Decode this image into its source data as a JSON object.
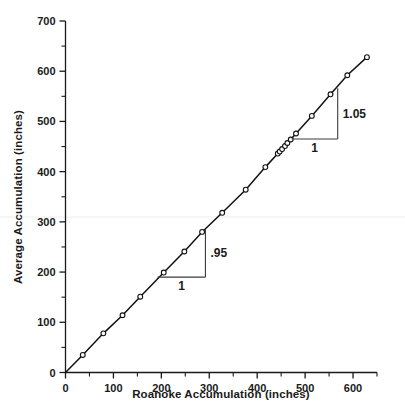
{
  "chart_data": {
    "type": "line",
    "title": "",
    "xlabel": "Roanoke Accumulation (inches)",
    "ylabel": "Average Accumulation (inches)",
    "xlim": [
      0,
      650
    ],
    "ylim": [
      0,
      700
    ],
    "xticks": [
      0,
      100,
      200,
      300,
      400,
      500,
      600
    ],
    "yticks": [
      0,
      100,
      200,
      300,
      400,
      500,
      600,
      700
    ],
    "xtick_labels": [
      "0",
      "100",
      "200",
      "300",
      "400",
      "500",
      "600"
    ],
    "ytick_labels": [
      "0",
      "100",
      "200",
      "300",
      "400",
      "500",
      "600",
      "700"
    ],
    "x_minor_step": 50,
    "y_minor_step": 50,
    "grid": false,
    "legend": false,
    "marker": "open-circle",
    "series": [
      {
        "name": "Double mass curve",
        "x": [
          0,
          36,
          79,
          119,
          156,
          205,
          248,
          285,
          327,
          376,
          417,
          443,
          447,
          452,
          458,
          463,
          470,
          481,
          514,
          553,
          588,
          629
        ],
        "y": [
          0,
          35,
          78,
          114,
          151,
          199,
          241,
          280,
          318,
          364,
          409,
          436,
          440,
          445,
          451,
          457,
          464,
          476,
          511,
          554,
          592,
          628
        ]
      }
    ],
    "annotations": [
      {
        "name": "lower-slope-triangle",
        "rise_label": ".95",
        "run_label": "1",
        "x_start": 192,
        "x_end": 292,
        "y_start": 190,
        "y_end": 285
      },
      {
        "name": "upper-slope-triangle",
        "rise_label": "1.05",
        "run_label": "1",
        "x_start": 472,
        "x_end": 568,
        "y_start": 465,
        "y_end": 566
      }
    ]
  },
  "annotations_text": {
    "lower_rise": ".95",
    "lower_run": "1",
    "upper_rise": "1.05",
    "upper_run": "1"
  },
  "axes": {
    "x_title": "Roanoke Accumulation (inches)",
    "y_title": "Average Accumulation (inches)",
    "x_labels": [
      "0",
      "100",
      "200",
      "300",
      "400",
      "500",
      "600"
    ],
    "y_labels": [
      "0",
      "100",
      "200",
      "300",
      "400",
      "500",
      "600",
      "700"
    ]
  },
  "colors": {
    "ink": "#1a1a1a",
    "line": "#111111",
    "marker_fill": "#ffffff",
    "annotation": "#3a3a3a",
    "background": "#ffffff"
  }
}
